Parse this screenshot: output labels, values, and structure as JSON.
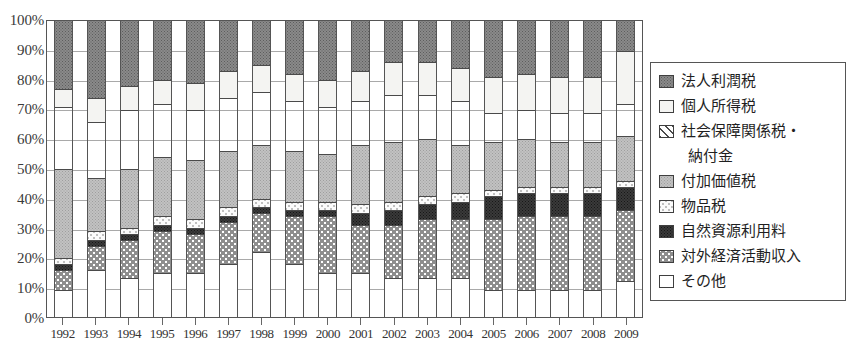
{
  "chart_data": {
    "type": "bar",
    "subtype": "stacked-percentage",
    "title": "",
    "xlabel": "",
    "ylabel": "",
    "ylim": [
      0,
      100
    ],
    "ytick_labels": [
      "100%",
      "90%",
      "80%",
      "70%",
      "60%",
      "50%",
      "40%",
      "30%",
      "20%",
      "10%",
      "0%"
    ],
    "ytick_values": [
      100,
      90,
      80,
      70,
      60,
      50,
      40,
      30,
      20,
      10,
      0
    ],
    "grid": true,
    "legend_position": "right",
    "categories": [
      "1992",
      "1993",
      "1994",
      "1995",
      "1996",
      "1997",
      "1998",
      "1999",
      "2000",
      "2001",
      "2002",
      "2003",
      "2004",
      "2005",
      "2006",
      "2007",
      "2008",
      "2009"
    ],
    "stack_order_bottom_to_top": [
      "その他",
      "対外経済活動収入",
      "自然資源利用料",
      "物品税",
      "付加価値税",
      "社会保障関係税・納付金",
      "個人所得税",
      "法人利潤税"
    ],
    "series": [
      {
        "name": "法人利潤税",
        "values": [
          23,
          26,
          22,
          20,
          21,
          17,
          15,
          18,
          20,
          17,
          14,
          14,
          16,
          19,
          18,
          19,
          19,
          10
        ]
      },
      {
        "name": "個人所得税",
        "values": [
          6,
          8,
          8,
          8,
          9,
          9,
          9,
          9,
          9,
          10,
          11,
          11,
          11,
          12,
          12,
          12,
          12,
          18
        ]
      },
      {
        "name": "社会保障関係税・納付金",
        "values": [
          21,
          19,
          20,
          18,
          17,
          18,
          18,
          17,
          16,
          15,
          16,
          15,
          15,
          10,
          10,
          10,
          10,
          11
        ]
      },
      {
        "name": "付加価値税",
        "values": [
          30,
          18,
          20,
          20,
          20,
          19,
          18,
          17,
          16,
          20,
          20,
          19,
          16,
          16,
          16,
          15,
          15,
          15
        ]
      },
      {
        "name": "物品税",
        "values": [
          2,
          3,
          2,
          3,
          3,
          3,
          3,
          3,
          3,
          3,
          3,
          3,
          3,
          2,
          2,
          2,
          2,
          2
        ]
      },
      {
        "name": "自然資源利用料",
        "values": [
          2,
          2,
          2,
          2,
          2,
          2,
          2,
          2,
          2,
          4,
          5,
          5,
          6,
          8,
          8,
          8,
          8,
          8
        ]
      },
      {
        "name": "対外経済活動収入",
        "values": [
          7,
          8,
          13,
          14,
          13,
          14,
          13,
          16,
          19,
          16,
          18,
          20,
          20,
          24,
          25,
          25,
          25,
          24
        ]
      },
      {
        "name": "その他",
        "values": [
          9,
          16,
          13,
          15,
          15,
          18,
          22,
          18,
          15,
          15,
          13,
          13,
          13,
          9,
          9,
          9,
          9,
          12
        ]
      }
    ]
  },
  "y_axis": {
    "ticks": [
      "100%",
      "90%",
      "80%",
      "70%",
      "60%",
      "50%",
      "40%",
      "30%",
      "20%",
      "10%",
      "0%"
    ]
  },
  "x_axis": {
    "labels": [
      "1992",
      "1993",
      "1994",
      "1995",
      "1996",
      "1997",
      "1998",
      "1999",
      "2000",
      "2001",
      "2002",
      "2003",
      "2004",
      "2005",
      "2006",
      "2007",
      "2008",
      "2009"
    ]
  },
  "legend": {
    "items": [
      {
        "label": "法人利潤税",
        "pattern": "p-corp",
        "swatch_name": "legend-swatch-corporate-profit-tax"
      },
      {
        "label": "個人所得税",
        "pattern": "p-income",
        "swatch_name": "legend-swatch-personal-income-tax"
      },
      {
        "label": "社会保障関係税・",
        "pattern": "p-social",
        "swatch_name": "legend-swatch-social-security-tax",
        "continuation": "納付金"
      },
      {
        "label": "付加価値税",
        "pattern": "p-vat",
        "swatch_name": "legend-swatch-value-added-tax"
      },
      {
        "label": "物品税",
        "pattern": "p-goods",
        "swatch_name": "legend-swatch-goods-tax"
      },
      {
        "label": "自然資源利用料",
        "pattern": "p-natres",
        "swatch_name": "legend-swatch-natural-resource-fee"
      },
      {
        "label": "対外経済活動収入",
        "pattern": "p-foreign",
        "swatch_name": "legend-swatch-foreign-economic-revenue"
      },
      {
        "label": "その他",
        "pattern": "p-other",
        "swatch_name": "legend-swatch-other"
      }
    ]
  },
  "colors": {
    "axis": "#555555",
    "grid": "#a9a9a9",
    "text": "#2b2b2b",
    "background": "#ffffff"
  }
}
